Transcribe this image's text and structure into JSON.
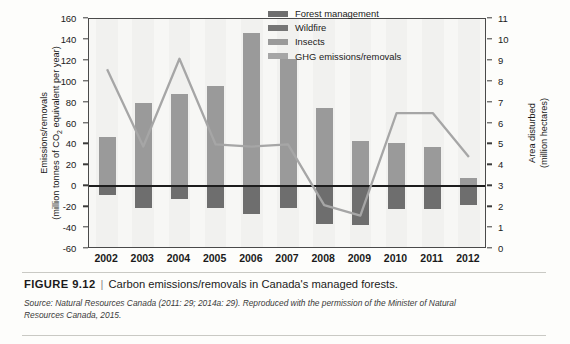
{
  "figure": {
    "label": "FIGURE 9.12",
    "separator": "|",
    "title": "Carbon emissions/removals in Canada's managed forests.",
    "source": "Source: Natural Resources Canada (2011: 29; 2014a: 29). Reproduced with the permission of the Minister of Natural Resources Canada, 2015."
  },
  "axis": {
    "left_label_line1": "Emissions/removals",
    "left_label_line2_pre": "(million tonnes of CO",
    "left_label_line2_sub": "2",
    "left_label_line2_post": " equivalent per year)",
    "right_label_line1": "Area disturbed",
    "right_label_line2": "(million hectares)"
  },
  "legend": {
    "items": [
      {
        "label": "Forest management",
        "color": "#6e6e6e"
      },
      {
        "label": "Wildfire",
        "color": "#757575"
      },
      {
        "label": "Insects",
        "color": "#9a9a9a"
      },
      {
        "label": "GHG emissions/removals",
        "color": "#a6a6a6"
      }
    ]
  },
  "chart_data": {
    "type": "bar",
    "title": "Carbon emissions/removals in Canada's managed forests.",
    "xlabel": "",
    "ylabel": "Emissions/removals (million tonnes of CO2 equivalent per year)",
    "y2label": "Area disturbed (million hectares)",
    "categories": [
      "2002",
      "2003",
      "2004",
      "2005",
      "2006",
      "2007",
      "2008",
      "2009",
      "2010",
      "2011",
      "2012"
    ],
    "ylim": [
      -60,
      160
    ],
    "yticks": [
      160,
      140,
      120,
      100,
      80,
      60,
      40,
      20,
      0,
      -20,
      -40,
      -60
    ],
    "y2lim": [
      0,
      11
    ],
    "y2ticks": [
      11,
      10,
      9,
      8,
      7,
      6,
      5,
      4,
      3,
      2,
      1,
      0
    ],
    "grid": false,
    "legend_position": "top-center-right",
    "series": [
      {
        "name": "Insects",
        "axis": "left",
        "type": "bar",
        "values": [
          47,
          80,
          88,
          96,
          147,
          122,
          75,
          43,
          41,
          38,
          8
        ]
      },
      {
        "name": "Forest management",
        "axis": "left",
        "type": "bar",
        "values": [
          -8,
          -21,
          -12,
          -21,
          -27,
          -21,
          -36,
          -37,
          -22,
          -22,
          -18
        ]
      },
      {
        "name": "GHG emissions/removals",
        "axis": "right",
        "type": "line",
        "values": [
          8.6,
          4.9,
          9.1,
          5.0,
          4.9,
          5.0,
          2.1,
          1.6,
          6.5,
          6.5,
          4.4
        ]
      }
    ]
  }
}
